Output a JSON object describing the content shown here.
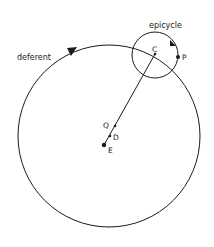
{
  "diagram": {
    "labels": {
      "deferent": "deferent",
      "epicycle": "epicycle",
      "C": "C",
      "P": "P",
      "Q": "Q",
      "D": "D",
      "E": "E"
    },
    "colors": {
      "stroke": "#1a1a1a",
      "background": "#ffffff"
    },
    "geometry": {
      "deferent": {
        "cx": 109,
        "cy": 136,
        "r": 91
      },
      "epicycle": {
        "cx": 155,
        "cy": 55,
        "r": 23
      },
      "points": {
        "C": [
          155,
          54
        ],
        "P": [
          178,
          57
        ],
        "Q": [
          115,
          126
        ],
        "D": [
          110,
          136
        ],
        "E": [
          104,
          145
        ]
      }
    }
  }
}
